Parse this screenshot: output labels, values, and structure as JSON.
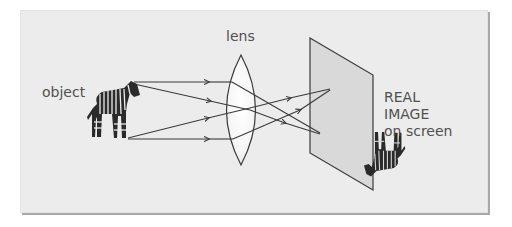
{
  "diagram": {
    "labels": {
      "object": "object",
      "lens": "lens",
      "image_line1": "REAL",
      "image_line2": "IMAGE",
      "image_line3": "on screen"
    },
    "elements": {
      "object": "zebra (upright)",
      "lens": "double-convex lens",
      "screen": "translucent screen",
      "image": "zebra (inverted)"
    },
    "rays": [
      {
        "from": "object-top",
        "to": "image-bottom",
        "path": "parallel then refracted"
      },
      {
        "from": "object-top",
        "to": "image-bottom",
        "path": "diverging then converging"
      },
      {
        "from": "object-bottom",
        "to": "image-top",
        "path": "diverging then converging"
      },
      {
        "from": "object-bottom",
        "to": "image-top",
        "path": "parallel then refracted"
      }
    ],
    "colors": {
      "background": "#ececec",
      "line": "#3a3a3a",
      "lens_fill": "#ffffff",
      "screen_fill": "#d9d9d9",
      "text": "#505050"
    }
  }
}
